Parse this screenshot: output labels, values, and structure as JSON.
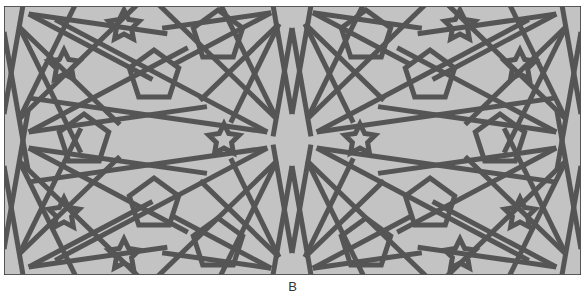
{
  "figure": {
    "caption": "B",
    "colors": {
      "background": "#c3c3c3",
      "strap": "#555555",
      "border": "#333333"
    },
    "center_star_points": 10
  }
}
